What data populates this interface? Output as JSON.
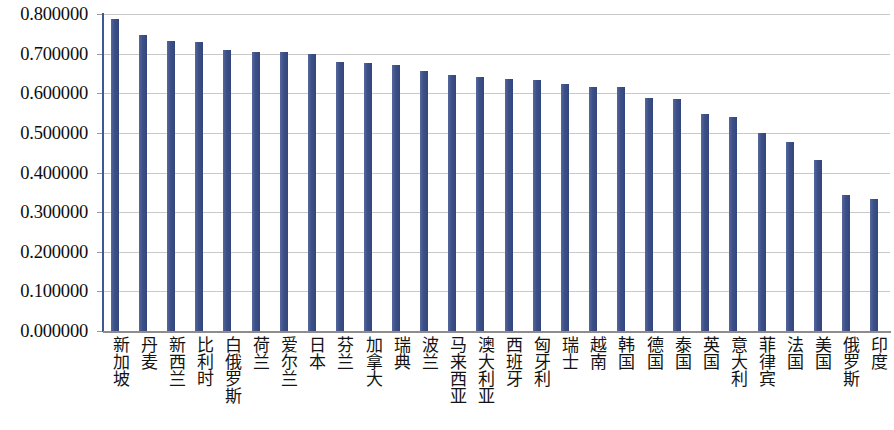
{
  "chart_data": {
    "type": "bar",
    "title": "",
    "subtitle": "",
    "xlabel": "",
    "ylabel": "",
    "ylim": [
      0.0,
      0.8
    ],
    "grid": true,
    "legend": null,
    "bar_color": "#42558d",
    "gridline_color": "#c9c9c9",
    "axis_color": "#3e5893",
    "y_ticks": [
      "0.000000",
      "0.100000",
      "0.200000",
      "0.300000",
      "0.400000",
      "0.500000",
      "0.600000",
      "0.700000",
      "0.800000"
    ],
    "y_tick_values": [
      0.0,
      0.1,
      0.2,
      0.3,
      0.4,
      0.5,
      0.6,
      0.7,
      0.8
    ],
    "categories": [
      "新加坡",
      "丹麦",
      "新西兰",
      "比利时",
      "白俄罗斯",
      "荷兰",
      "爱尔兰",
      "日本",
      "芬兰",
      "加拿大",
      "瑞典",
      "波兰",
      "马来西亚",
      "澳大利亚",
      "西班牙",
      "匈牙利",
      "瑞士",
      "越南",
      "韩国",
      "德国",
      "泰国",
      "英国",
      "意大利",
      "菲律宾",
      "法国",
      "美国",
      "俄罗斯",
      "印度"
    ],
    "values": [
      0.788,
      0.747,
      0.731,
      0.729,
      0.71,
      0.703,
      0.703,
      0.699,
      0.68,
      0.676,
      0.671,
      0.657,
      0.646,
      0.641,
      0.636,
      0.633,
      0.624,
      0.617,
      0.615,
      0.588,
      0.585,
      0.548,
      0.539,
      0.5,
      0.477,
      0.431,
      0.343,
      0.333
    ]
  }
}
